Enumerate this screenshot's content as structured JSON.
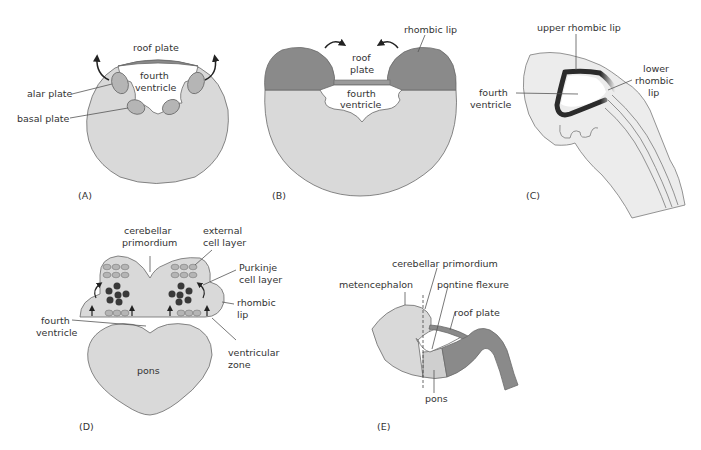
{
  "colors": {
    "tissue_light": "#d9d9d9",
    "tissue_mid": "#b5b5b5",
    "tissue_dark": "#8a8a8a",
    "cell_dark": "#3a3a3a",
    "outline": "#6a6a6a",
    "ventricle_rim": "#2b2b2b"
  },
  "panels": {
    "A": {
      "tag": "(A)",
      "labels": {
        "roof_plate": "roof plate",
        "fourth_ventricle_1": "fourth",
        "fourth_ventricle_2": "ventricle",
        "alar_plate": "alar plate",
        "basal_plate": "basal plate"
      }
    },
    "B": {
      "tag": "(B)",
      "labels": {
        "rhombic_lip": "rhombic lip",
        "roof_plate_1": "roof",
        "roof_plate_2": "plate",
        "fourth_ventricle_1": "fourth",
        "fourth_ventricle_2": "ventricle"
      }
    },
    "C": {
      "tag": "(C)",
      "labels": {
        "upper_rhombic_lip": "upper rhombic lip",
        "lower_rhombic_lip_1": "lower",
        "lower_rhombic_lip_2": "rhombic",
        "lower_rhombic_lip_3": "lip",
        "fourth_ventricle_1": "fourth",
        "fourth_ventricle_2": "ventricle"
      }
    },
    "D": {
      "tag": "(D)",
      "labels": {
        "cerebellar_primordium_1": "cerebellar",
        "cerebellar_primordium_2": "primordium",
        "external_cell_layer_1": "external",
        "external_cell_layer_2": "cell layer",
        "purkinje_cell_layer_1": "Purkinje",
        "purkinje_cell_layer_2": "cell layer",
        "rhombic_lip_1": "rhombic",
        "rhombic_lip_2": "lip",
        "fourth_ventricle_1": "fourth",
        "fourth_ventricle_2": "ventricle",
        "ventricular_zone_1": "ventricular",
        "ventricular_zone_2": "zone",
        "pons": "pons"
      }
    },
    "E": {
      "tag": "(E)",
      "labels": {
        "cerebellar_primordium": "cerebellar primordium",
        "metencephalon": "metencephalon",
        "pontine_flexure": "pontine flexure",
        "roof_plate": "roof plate",
        "pons": "pons"
      }
    }
  }
}
